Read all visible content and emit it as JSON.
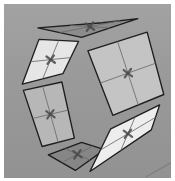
{
  "viewport": {
    "name": "3d-viewport",
    "background": "#9a9a9a",
    "floor_line_color": "#7f7f7f"
  },
  "panels": [
    {
      "id": "top",
      "corners": [
        [
          36,
          27
        ],
        [
          98,
          22
        ],
        [
          132,
          18
        ],
        [
          78,
          36
        ]
      ],
      "fill": "#8c8c8c",
      "center": [
        88,
        26
      ]
    },
    {
      "id": "upper-left",
      "corners": [
        [
          37,
          38
        ],
        [
          75,
          40
        ],
        [
          60,
          71
        ],
        [
          21,
          81
        ]
      ],
      "fill": "#e6e6e6",
      "center": [
        48,
        57
      ]
    },
    {
      "id": "right",
      "corners": [
        [
          84,
          49
        ],
        [
          141,
          31
        ],
        [
          157,
          91
        ],
        [
          108,
          111
        ]
      ],
      "fill": "#c4c4c4",
      "center": [
        122,
        68
      ]
    },
    {
      "id": "lower-left",
      "corners": [
        [
          22,
          87
        ],
        [
          59,
          79
        ],
        [
          71,
          133
        ],
        [
          40,
          141
        ]
      ],
      "fill": "#b7b7b7",
      "center": [
        52,
        110
      ]
    },
    {
      "id": "bottom",
      "corners": [
        [
          46,
          149
        ],
        [
          78,
          137
        ],
        [
          100,
          144
        ],
        [
          72,
          164
        ]
      ],
      "fill": "#868686",
      "center": [
        78,
        151
      ]
    },
    {
      "id": "lower-right",
      "corners": [
        [
          106,
          124
        ],
        [
          153,
          101
        ],
        [
          145,
          125
        ],
        [
          86,
          165
        ]
      ],
      "fill": "#ededed",
      "center": [
        122,
        133
      ]
    }
  ],
  "style": {
    "edge_color": "#1e1e1e",
    "grid_color": "#6a6a6a",
    "marker_color": "#4a4a4a"
  }
}
